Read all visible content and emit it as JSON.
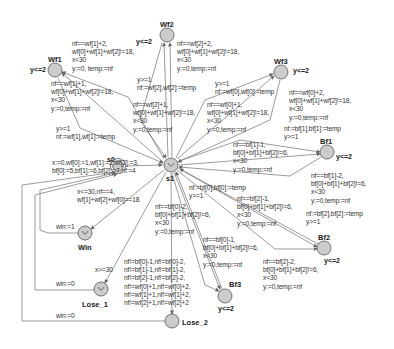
{
  "diagram": {
    "type": "timed-automaton",
    "colors": {
      "node_fill": "#c8c8c8",
      "node_stroke": "#555555",
      "edge": "#666666",
      "text": "#333333"
    },
    "nodes": [
      {
        "id": "s0",
        "name": "s0",
        "x": 118,
        "y": 166,
        "initial": true,
        "urgent": false,
        "invariant": ""
      },
      {
        "id": "s1",
        "name": "s1",
        "x": 171,
        "y": 165,
        "initial": false,
        "urgent": true,
        "invariant": ""
      },
      {
        "id": "Wf1",
        "name": "Wf1",
        "x": 55,
        "y": 70,
        "invariant": "y<=2"
      },
      {
        "id": "Wf2",
        "name": "Wf2",
        "x": 167,
        "y": 35,
        "invariant": "y<=2"
      },
      {
        "id": "Wf3",
        "name": "Wf3",
        "x": 281,
        "y": 72,
        "invariant": "y<=2"
      },
      {
        "id": "Bf1",
        "name": "Bf1",
        "x": 327,
        "y": 152,
        "invariant": "y<=2"
      },
      {
        "id": "Bf2",
        "name": "Bf2",
        "x": 324,
        "y": 248,
        "invariant": "y<=2"
      },
      {
        "id": "Bf3",
        "name": "Bf3",
        "x": 225,
        "y": 296,
        "invariant": "y<=2"
      },
      {
        "id": "Win",
        "name": "Win",
        "x": 85,
        "y": 233,
        "urgent": true,
        "invariant": ""
      },
      {
        "id": "Lose_1",
        "name": "Lose_1",
        "x": 101,
        "y": 289,
        "urgent": true,
        "invariant": ""
      },
      {
        "id": "Lose_2",
        "name": "Lose_2",
        "x": 172,
        "y": 321,
        "invariant": ""
      }
    ],
    "edges": [
      {
        "from": "s0",
        "to": "s1",
        "label": [
          "x:=0,wf[0]:=1,wf[1]:=2,wf[2]:=3,",
          "bf[0]:=5,bf[1]:=6,bf[2]:=7,nf:=4"
        ]
      },
      {
        "from": "s1",
        "to": "Wf1",
        "label": [
          "nf==wf[1]+2,",
          "wf[0]+wf[1]+wf[2]!=18,",
          "x<30",
          "y:=0, temp:=nf"
        ]
      },
      {
        "from": "s1",
        "to": "Wf1",
        "label": [
          "nf==wf[1]+1,",
          "wf[0]+wf[1]+wf[2]!=18,",
          "x<30",
          "y:=0,temp:=nf"
        ]
      },
      {
        "from": "Wf1",
        "to": "s1",
        "label": [
          "y>=1",
          "nf:=wf[1],wf[1]:=temp"
        ]
      },
      {
        "from": "s1",
        "to": "Wf2",
        "label": [
          "nf==wf[2]+2,",
          "wf[0]+wf[1]+wf[2]!=18,",
          "x<30",
          "y:=0,temp:=nf"
        ]
      },
      {
        "from": "s1",
        "to": "Wf2",
        "label": [
          "nf==wf[2]+1,",
          "wf[0]+wf[1]+wf[2]!=18,",
          "x<30",
          "y:=0,temp:=nf"
        ]
      },
      {
        "from": "Wf2",
        "to": "s1",
        "label": [
          "y>=1",
          "nf:=wf[2],wf[2]:=temp"
        ]
      },
      {
        "from": "s1",
        "to": "Wf3",
        "label": [
          "nf==wf[0]+2,",
          "wf[0]+wf[1]+wf[2]!=18,",
          "x<30",
          "y:=0,temp:=nf"
        ]
      },
      {
        "from": "s1",
        "to": "Wf3",
        "label": [
          "nf==wf[0]+1,",
          "wf[0]+wf[1]+wf[2]!=18,",
          "x<30",
          "y:=0,temp:=nf"
        ]
      },
      {
        "from": "Wf3",
        "to": "s1",
        "label": [
          "y>=1",
          "nf:=wf[0],wf[0]:=temp"
        ]
      },
      {
        "from": "s1",
        "to": "Bf1",
        "label": [
          "nf==bf[1]-1,",
          "bf[0]+bf[1]+bf[2]!=6,",
          "x<30",
          "y:=0,temp:=nf"
        ]
      },
      {
        "from": "s1",
        "to": "Bf1",
        "label": [
          "nf==bf[1]-2,",
          "bf[0]+bf[1]+bf[2]!=6,",
          "x<30",
          "y:=0,temp:=nf"
        ]
      },
      {
        "from": "Bf1",
        "to": "s1",
        "label": [
          "nf:=bf[1],bf[1]:=temp",
          "y>=1"
        ]
      },
      {
        "from": "s1",
        "to": "Bf2",
        "label": [
          "nf==bf[2]-1,",
          "bf[0]+bf[1]+bf[2]!=6,",
          "x<30",
          "y:=0,temp:=nf"
        ]
      },
      {
        "from": "s1",
        "to": "Bf2",
        "label": [
          "nf==bf[2]-2,",
          "bf[0]+bf[1]+bf[2]!=6,",
          "x<30",
          "y:=0,temp:=nf"
        ]
      },
      {
        "from": "Bf2",
        "to": "s1",
        "label": [
          "nf:=bf[2],bf[2]:=temp",
          "y>=1"
        ]
      },
      {
        "from": "s1",
        "to": "Bf3",
        "label": [
          "nf==bf[0]-2,",
          "bf[0]+bf[1]+bf[2]!=6,",
          "x<30",
          "y:=0,temp:=nf"
        ]
      },
      {
        "from": "s1",
        "to": "Bf3",
        "label": [
          "nf==bf[0]-1,",
          "bf[0]+bf[1]+bf[2]!=6,",
          "x<30",
          "y:=0,temp:=nf"
        ]
      },
      {
        "from": "Bf3",
        "to": "s1",
        "label": [
          "nf:=bf[0],bf[0]:=temp",
          "y>=1"
        ]
      },
      {
        "from": "s1",
        "to": "Win",
        "label": [
          "x<=30,nf==4,",
          "wf[1]+wf[2]+wf[0]==18"
        ]
      },
      {
        "from": "s1",
        "to": "Lose_1",
        "label": [
          "x>=30"
        ]
      },
      {
        "from": "s1",
        "to": "Lose_2",
        "label": [
          "nf!=bf[0]-1,nf!=bf[0]-2,",
          "nf!=bf[1]-1,nf!=bf[1]-2,",
          "nf!=bf[2]-1,nf!=bf[2]-2,",
          "nf!=wf[0]+1,nf!=wf[0]+2,",
          "nf!=wf[1]+1,nf!=wf[1]+2,",
          "nf!=wf[2]+1,nf!=wf[2]+2"
        ]
      },
      {
        "from": "Win",
        "to": "s0",
        "label": [
          "win:=1"
        ]
      },
      {
        "from": "Lose_1",
        "to": "s0",
        "label": [
          "win:=0"
        ]
      },
      {
        "from": "Lose_2",
        "to": "s0",
        "label": [
          "win:=0"
        ]
      }
    ]
  },
  "labels": {
    "s0_s1": [
      "x:=0,wf[0]:=1,wf[1]:=2,wf[2]:=3,",
      "bf[0]:=5,bf[1]:=6,bf[2]:=7,nf:=4"
    ],
    "wf1_a": [
      "nf==wf[1]+2,",
      "wf[0]+wf[1]+wf[2]!=18,",
      "x<30",
      "y:=0, temp:=nf"
    ],
    "wf1_b": [
      "nf==wf[1]+1,",
      "wf[0]+wf[1]+wf[2]!=18,",
      "x<30",
      "y:=0,temp:=nf"
    ],
    "wf1_back": [
      "y>=1",
      "nf:=wf[1],wf[1]:=temp"
    ],
    "wf2_a": [
      "nf==wf[2]+2,",
      "wf[0]+wf[1]+wf[2]!=18,",
      "x<30",
      "y:=0,temp:=nf"
    ],
    "wf2_b": [
      "nf==wf[2]+1,",
      "wf[0]+wf[1]+wf[2]!=18,",
      "x<30",
      "y:=0,temp:=nf"
    ],
    "wf2_back": [
      "y>=1",
      "nf:=wf[2],wf[2]:=temp"
    ],
    "wf3_a": [
      "nf==wf[0]+2,",
      "wf[0]+wf[1]+wf[2]!=18,",
      "x<30",
      "y:=0,temp:=nf"
    ],
    "wf3_b": [
      "nf==wf[0]+1,",
      "wf[0]+wf[1]+wf[2]!=18,",
      "x<30",
      "y:=0,temp:=nf"
    ],
    "wf3_back": [
      "y>=1",
      "nf:=wf[0],wf[0]:=temp"
    ],
    "bf1_a": [
      "nf==bf[1]-1,",
      "bf[0]+bf[1]+bf[2]!=6,",
      "x<30",
      "y:=0,temp:=nf"
    ],
    "bf1_b": [
      "nf==bf[1]-2,",
      "bf[0]+bf[1]+bf[2]!=6,",
      "x<30",
      "y:=0,temp:=nf"
    ],
    "bf1_back": [
      "nf:=bf[1],bf[1]:=temp",
      "y>=1"
    ],
    "bf2_a": [
      "nf==bf[2]-1,",
      "bf[0]+bf[1]+bf[2]!=6,",
      "x<30",
      "y:=0,temp:=nf"
    ],
    "bf2_b": [
      "nf==bf[2]-2,",
      "bf[0]+bf[1]+bf[2]!=6,",
      "x<30",
      "y:=0,temp:=nf"
    ],
    "bf2_back": [
      "nf:=bf[2],bf[2]:=temp",
      "y>=1"
    ],
    "bf3_a": [
      "nf==bf[0]-2,",
      "bf[0]+bf[1]+bf[2]!=6,",
      "x<30",
      "y:=0,temp:=nf"
    ],
    "bf3_b": [
      "nf==bf[0]-1,",
      "bf[0]+bf[1]+bf[2]!=6,",
      "x<30",
      "y:=0,temp:=nf"
    ],
    "bf3_back": [
      "nf:=bf[0],bf[0]:=temp",
      "y>=1"
    ],
    "win": [
      "x<=30,nf==4,",
      "wf[1]+wf[2]+wf[0]==18"
    ],
    "lose1": [
      "x>=30"
    ],
    "lose2": [
      "nf!=bf[0]-1,nf!=bf[0]-2,",
      "nf!=bf[1]-1,nf!=bf[1]-2,",
      "nf!=bf[2]-1,nf!=bf[2]-2,",
      "nf!=wf[0]+1,nf!=wf[0]+2,",
      "nf!=wf[1]+1,nf!=wf[1]+2,",
      "nf!=wf[2]+1,nf!=wf[2]+2"
    ],
    "win_back": [
      "win:=1"
    ],
    "lose1_back": [
      "win:=0"
    ],
    "lose2_back": [
      "win:=0"
    ]
  },
  "names": {
    "s0": "s0",
    "s1": "s1",
    "Wf1": "Wf1",
    "Wf2": "Wf2",
    "Wf3": "Wf3",
    "Bf1": "Bf1",
    "Bf2": "Bf2",
    "Bf3": "Bf3",
    "Win": "Win",
    "Lose_1": "Lose_1",
    "Lose_2": "Lose_2"
  },
  "invariants": {
    "Wf1": "y<=2",
    "Wf2": "y<=2",
    "Wf3": "y<=2",
    "Bf1": "y<=2",
    "Bf2": "y<=2",
    "Bf3": "y<=2"
  }
}
